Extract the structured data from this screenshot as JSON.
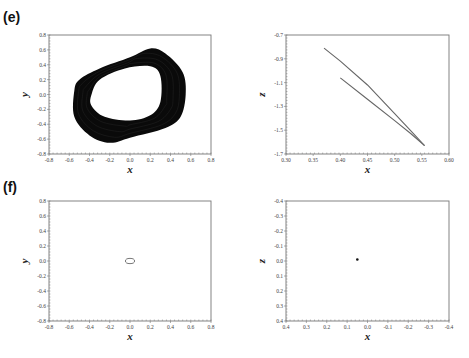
{
  "figure": {
    "panels": [
      {
        "id": "e",
        "label": "(e)"
      },
      {
        "id": "f",
        "label": "(f)"
      }
    ]
  },
  "chart_data": [
    {
      "panel": "(e)",
      "position": "top-left",
      "type": "line",
      "title": "",
      "xlabel": "x",
      "ylabel": "y",
      "xlim": [
        -0.8,
        0.8
      ],
      "ylim": [
        -0.8,
        0.8
      ],
      "xticks": [
        "-0.8",
        "-0.6",
        "-0.4",
        "-0.2",
        "0.0",
        "0.2",
        "0.4",
        "0.6",
        "0.8"
      ],
      "yticks": [
        "-0.8",
        "-0.6",
        "-0.4",
        "-0.2",
        "0.0",
        "0.2",
        "0.4",
        "0.6",
        "0.8"
      ],
      "grid": false,
      "description": "Dense chaotic/quasi-periodic attractor band (filled black torus-like ring)",
      "outer_boundary": [
        [
          -0.55,
          0.05
        ],
        [
          -0.5,
          0.2
        ],
        [
          -0.3,
          0.35
        ],
        [
          0.0,
          0.5
        ],
        [
          0.2,
          0.62
        ],
        [
          0.35,
          0.55
        ],
        [
          0.52,
          0.3
        ],
        [
          0.55,
          0.0
        ],
        [
          0.5,
          -0.3
        ],
        [
          0.35,
          -0.45
        ],
        [
          0.0,
          -0.58
        ],
        [
          -0.2,
          -0.65
        ],
        [
          -0.4,
          -0.55
        ],
        [
          -0.55,
          -0.3
        ]
      ],
      "inner_boundary": [
        [
          -0.38,
          0.0
        ],
        [
          -0.3,
          0.2
        ],
        [
          -0.05,
          0.35
        ],
        [
          0.2,
          0.38
        ],
        [
          0.3,
          0.25
        ],
        [
          0.3,
          -0.1
        ],
        [
          0.2,
          -0.28
        ],
        [
          0.0,
          -0.35
        ],
        [
          -0.25,
          -0.3
        ],
        [
          -0.38,
          -0.15
        ]
      ]
    },
    {
      "panel": "(e)",
      "position": "top-right",
      "type": "line",
      "title": "",
      "xlabel": "x",
      "ylabel": "z",
      "xlim": [
        0.3,
        0.6
      ],
      "ylim": [
        -1.7,
        -0.7
      ],
      "xticks": [
        "0.30",
        "0.35",
        "0.40",
        "0.45",
        "0.50",
        "0.55",
        "0.60"
      ],
      "yticks": [
        "-1.7",
        "-1.5",
        "-1.3",
        "-1.1",
        "-0.9",
        "-0.7"
      ],
      "grid": false,
      "series": [
        {
          "name": "upper branch",
          "x": [
            0.37,
            0.4,
            0.45,
            0.5,
            0.535,
            0.555
          ],
          "y": [
            -0.81,
            -0.92,
            -1.12,
            -1.36,
            -1.53,
            -1.63
          ]
        },
        {
          "name": "lower branch",
          "x": [
            0.4,
            0.45,
            0.5,
            0.53,
            0.555
          ],
          "y": [
            -1.06,
            -1.24,
            -1.42,
            -1.53,
            -1.63
          ]
        }
      ]
    },
    {
      "panel": "(f)",
      "position": "bottom-left",
      "type": "line",
      "title": "",
      "xlabel": "x",
      "ylabel": "y",
      "xlim": [
        -0.8,
        0.8
      ],
      "ylim": [
        -0.8,
        0.8
      ],
      "xticks": [
        "-0.8",
        "-0.6",
        "-0.4",
        "-0.2",
        "0.0",
        "0.2",
        "0.4",
        "0.6",
        "0.8"
      ],
      "yticks": [
        "-0.8",
        "-0.6",
        "-0.4",
        "-0.2",
        "0.0",
        "0.2",
        "0.4",
        "0.6",
        "0.8"
      ],
      "grid": false,
      "description": "Small closed limit cycle near origin",
      "series": [
        {
          "name": "limit cycle",
          "center": [
            0.0,
            0.0
          ],
          "rx": 0.045,
          "ry": 0.035
        }
      ]
    },
    {
      "panel": "(f)",
      "position": "bottom-right",
      "type": "scatter",
      "title": "",
      "xlabel": "x",
      "ylabel": "z",
      "xlim": [
        0.4,
        -0.4
      ],
      "ylim": [
        0.4,
        -0.4
      ],
      "xticks": [
        "0.4",
        "0.3",
        "0.2",
        "0.1",
        "0.0",
        "-0.1",
        "-0.2",
        "-0.3",
        "-0.4"
      ],
      "yticks": [
        "-0.4",
        "-0.3",
        "-0.2",
        "-0.1",
        "0.0",
        "0.1",
        "0.2",
        "0.3",
        "0.4"
      ],
      "grid": false,
      "description": "Trajectory collapsed to a near-point",
      "series": [
        {
          "name": "point",
          "x": [
            0.05
          ],
          "y": [
            -0.01
          ]
        }
      ]
    }
  ]
}
